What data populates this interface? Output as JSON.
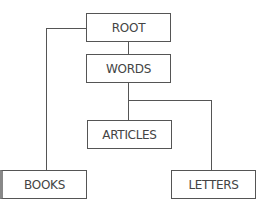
{
  "diagram": {
    "type": "tree",
    "nodes": {
      "root": "ROOT",
      "words": "WORDS",
      "articles": "ARTICLES",
      "books": "BOOKS",
      "letters": "LETTERS"
    },
    "edges": [
      [
        "ROOT",
        "WORDS"
      ],
      [
        "ROOT",
        "BOOKS"
      ],
      [
        "WORDS",
        "ARTICLES"
      ],
      [
        "WORDS",
        "LETTERS"
      ]
    ],
    "colors": {
      "line": "#555555",
      "text": "#444444",
      "background": "#ffffff"
    }
  }
}
